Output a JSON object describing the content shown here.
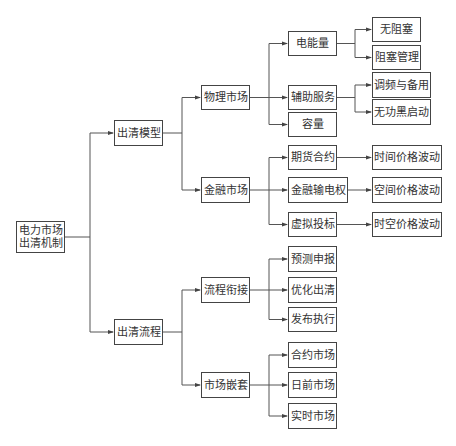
{
  "colors": {
    "line": "#555555",
    "border": "#444444",
    "text": "#333333",
    "background": "#ffffff"
  },
  "nodes": [
    {
      "id": "root",
      "label": "电力市场\n出清机制",
      "x": 16,
      "y": 221,
      "w": 49,
      "h": 32
    },
    {
      "id": "clear_model",
      "label": "出清模型",
      "x": 114,
      "y": 120,
      "w": 49,
      "h": 26
    },
    {
      "id": "clear_process",
      "label": "出清流程",
      "x": 114,
      "y": 319,
      "w": 49,
      "h": 26
    },
    {
      "id": "physical_market",
      "label": "物理市场",
      "x": 201,
      "y": 85,
      "w": 49,
      "h": 25
    },
    {
      "id": "financial_market",
      "label": "金融市场",
      "x": 201,
      "y": 177,
      "w": 49,
      "h": 26
    },
    {
      "id": "process_link",
      "label": "流程衔接",
      "x": 201,
      "y": 277,
      "w": 49,
      "h": 26
    },
    {
      "id": "market_nesting",
      "label": "市场嵌套",
      "x": 201,
      "y": 372,
      "w": 49,
      "h": 26
    },
    {
      "id": "energy",
      "label": "电能量",
      "x": 288,
      "y": 31,
      "w": 49,
      "h": 25
    },
    {
      "id": "ancillary",
      "label": "辅助服务",
      "x": 288,
      "y": 85,
      "w": 49,
      "h": 25
    },
    {
      "id": "capacity",
      "label": "容量",
      "x": 288,
      "y": 112,
      "w": 49,
      "h": 25
    },
    {
      "id": "futures",
      "label": "期货合约",
      "x": 288,
      "y": 145,
      "w": 49,
      "h": 25
    },
    {
      "id": "ftr",
      "label": "金融输电权",
      "x": 288,
      "y": 177,
      "w": 60,
      "h": 26
    },
    {
      "id": "virtual_bid",
      "label": "虚拟投标",
      "x": 288,
      "y": 212,
      "w": 49,
      "h": 25
    },
    {
      "id": "forecast_bid",
      "label": "预测申报",
      "x": 288,
      "y": 246,
      "w": 49,
      "h": 26
    },
    {
      "id": "opt_clear",
      "label": "优化出清",
      "x": 288,
      "y": 277,
      "w": 49,
      "h": 26
    },
    {
      "id": "publish_exec",
      "label": "发布执行",
      "x": 288,
      "y": 307,
      "w": 49,
      "h": 25
    },
    {
      "id": "contract_market",
      "label": "合约市场",
      "x": 288,
      "y": 342,
      "w": 49,
      "h": 26
    },
    {
      "id": "dayahead_market",
      "label": "日前市场",
      "x": 288,
      "y": 372,
      "w": 49,
      "h": 26
    },
    {
      "id": "realtime_market",
      "label": "实时市场",
      "x": 288,
      "y": 403,
      "w": 49,
      "h": 26
    },
    {
      "id": "no_congestion",
      "label": "无阻塞",
      "x": 372,
      "y": 17,
      "w": 49,
      "h": 25
    },
    {
      "id": "congestion_mgmt",
      "label": "阻塞管理",
      "x": 372,
      "y": 45,
      "w": 49,
      "h": 25
    },
    {
      "id": "freq_reserve",
      "label": "调频与备用",
      "x": 372,
      "y": 72,
      "w": 59,
      "h": 26
    },
    {
      "id": "reactive_blackstart",
      "label": "无功黑启动",
      "x": 372,
      "y": 99,
      "w": 59,
      "h": 26
    },
    {
      "id": "time_price",
      "label": "时间价格波动",
      "x": 372,
      "y": 145,
      "w": 70,
      "h": 25
    },
    {
      "id": "space_price",
      "label": "空间价格波动",
      "x": 372,
      "y": 177,
      "w": 70,
      "h": 26
    },
    {
      "id": "spacetime_price",
      "label": "时空价格波动",
      "x": 372,
      "y": 212,
      "w": 70,
      "h": 25
    }
  ],
  "edges": [
    [
      "root",
      "clear_model"
    ],
    [
      "root",
      "clear_process"
    ],
    [
      "clear_model",
      "physical_market"
    ],
    [
      "clear_model",
      "financial_market"
    ],
    [
      "clear_process",
      "process_link"
    ],
    [
      "clear_process",
      "market_nesting"
    ],
    [
      "physical_market",
      "energy"
    ],
    [
      "physical_market",
      "ancillary"
    ],
    [
      "physical_market",
      "capacity"
    ],
    [
      "financial_market",
      "futures"
    ],
    [
      "financial_market",
      "ftr"
    ],
    [
      "financial_market",
      "virtual_bid"
    ],
    [
      "process_link",
      "forecast_bid"
    ],
    [
      "process_link",
      "opt_clear"
    ],
    [
      "process_link",
      "publish_exec"
    ],
    [
      "market_nesting",
      "contract_market"
    ],
    [
      "market_nesting",
      "dayahead_market"
    ],
    [
      "market_nesting",
      "realtime_market"
    ],
    [
      "energy",
      "no_congestion"
    ],
    [
      "energy",
      "congestion_mgmt"
    ],
    [
      "ancillary",
      "freq_reserve"
    ],
    [
      "ancillary",
      "reactive_blackstart"
    ],
    [
      "futures",
      "time_price"
    ],
    [
      "ftr",
      "space_price"
    ],
    [
      "virtual_bid",
      "spacetime_price"
    ]
  ]
}
